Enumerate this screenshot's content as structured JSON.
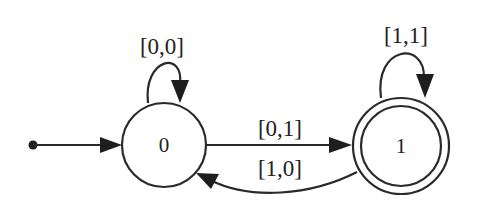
{
  "diagram": {
    "type": "finite-state-automaton",
    "states": [
      {
        "id": "0",
        "label": "0",
        "initial": true,
        "accepting": false
      },
      {
        "id": "1",
        "label": "1",
        "initial": false,
        "accepting": true
      }
    ],
    "transitions": [
      {
        "from": "0",
        "to": "0",
        "label": "[0,0]"
      },
      {
        "from": "0",
        "to": "1",
        "label": "[0,1]"
      },
      {
        "from": "1",
        "to": "0",
        "label": "[1,0]"
      },
      {
        "from": "1",
        "to": "1",
        "label": "[1,1]"
      }
    ]
  },
  "colors": {
    "stroke": "#2a2a2a",
    "background": "#ffffff"
  }
}
